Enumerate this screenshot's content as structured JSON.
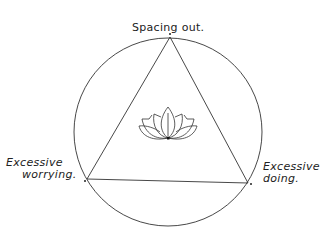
{
  "diagram": {
    "labels": {
      "top": "Spacing out.",
      "left_line1": "Excessive",
      "left_line2": "worrying.",
      "right_line1": "Excessive",
      "right_line2": "doing."
    },
    "center_symbol": "lotus-icon",
    "stroke_color": "#333333"
  }
}
